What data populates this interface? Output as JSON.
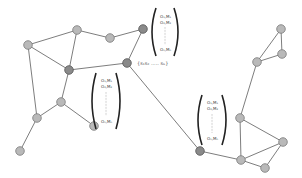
{
  "diagram": {
    "colors": {
      "edge": "#6e6e6e",
      "node_light": "#b9b9b9",
      "node_dark": "#8a8a8a",
      "bracket": "#222222"
    },
    "nodes": [
      {
        "id": "A",
        "type": "light"
      },
      {
        "id": "B",
        "type": "light"
      },
      {
        "id": "C",
        "type": "light"
      },
      {
        "id": "D",
        "type": "dark"
      },
      {
        "id": "E",
        "type": "dark"
      },
      {
        "id": "F",
        "type": "dark"
      },
      {
        "id": "G",
        "type": "light"
      },
      {
        "id": "H",
        "type": "light"
      },
      {
        "id": "I",
        "type": "light"
      },
      {
        "id": "J",
        "type": "light"
      },
      {
        "id": "K",
        "type": "dark"
      },
      {
        "id": "L",
        "type": "light"
      },
      {
        "id": "M",
        "type": "light"
      },
      {
        "id": "N",
        "type": "light"
      },
      {
        "id": "O",
        "type": "light"
      },
      {
        "id": "P",
        "type": "light"
      },
      {
        "id": "Q",
        "type": "light"
      },
      {
        "id": "R",
        "type": "light"
      }
    ],
    "edges": [
      [
        "A",
        "B"
      ],
      [
        "A",
        "E"
      ],
      [
        "A",
        "H"
      ],
      [
        "B",
        "C"
      ],
      [
        "C",
        "D"
      ],
      [
        "B",
        "E"
      ],
      [
        "E",
        "F"
      ],
      [
        "D",
        "F"
      ],
      [
        "F",
        "K"
      ],
      [
        "E",
        "G"
      ],
      [
        "G",
        "H"
      ],
      [
        "G",
        "I"
      ],
      [
        "H",
        "J"
      ],
      [
        "K",
        "N"
      ],
      [
        "N",
        "L"
      ],
      [
        "N",
        "M"
      ],
      [
        "N",
        "O"
      ],
      [
        "O",
        "M"
      ],
      [
        "L",
        "M"
      ],
      [
        "L",
        "P"
      ],
      [
        "P",
        "Q"
      ],
      [
        "P",
        "R"
      ],
      [
        "Q",
        "R"
      ]
    ],
    "hub_label": "{s₁s₂ ..... sₙ}",
    "matrices": [
      {
        "name": "top",
        "rows": [
          "O₁,M₁",
          "O₂,M₂",
          "Oₙ,Mₙ"
        ]
      },
      {
        "name": "middle",
        "rows": [
          "O₁,M₁",
          "O₂,M₂",
          "Oₙ,Mₙ"
        ]
      },
      {
        "name": "right",
        "rows": [
          "O₁,M₁",
          "O₂,M₂",
          "Oₙ,Mₙ"
        ]
      }
    ]
  }
}
